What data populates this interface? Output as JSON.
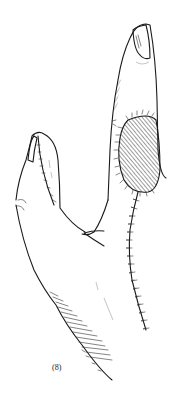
{
  "figure": {
    "label": "(8)",
    "colors": {
      "line": "#1a1a1a",
      "background": "#ffffff"
    }
  }
}
